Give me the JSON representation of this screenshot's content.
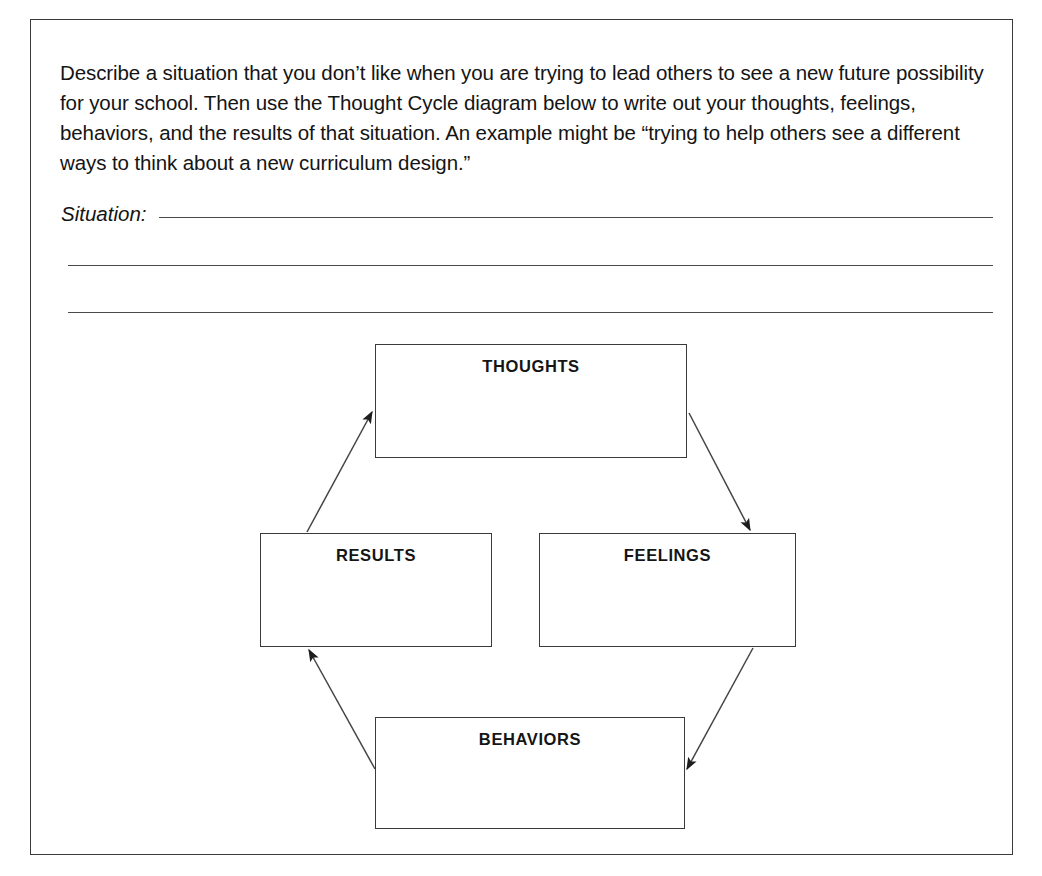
{
  "worksheet": {
    "instructions": "Describe a situation that you don’t like when you are trying to lead others to see a new future possibility for your school. Then use the Thought Cycle diagram below to write out your thoughts, feelings, behaviors, and the results of that situation. An example might be “trying to help others see a different ways to think about a new curriculum design.”",
    "situation_label": "Situation:",
    "answer_lines": [
      "",
      "",
      ""
    ]
  },
  "diagram": {
    "name": "Thought Cycle",
    "boxes": [
      {
        "id": "thoughts",
        "label": "THOUGHTS",
        "value": ""
      },
      {
        "id": "feelings",
        "label": "FEELINGS",
        "value": ""
      },
      {
        "id": "behaviors",
        "label": "BEHAVIORS",
        "value": ""
      },
      {
        "id": "results",
        "label": "RESULTS",
        "value": ""
      }
    ],
    "arrows": [
      {
        "from": "results",
        "to": "thoughts"
      },
      {
        "from": "thoughts",
        "to": "feelings"
      },
      {
        "from": "feelings",
        "to": "behaviors"
      },
      {
        "from": "behaviors",
        "to": "results"
      }
    ]
  },
  "colors": {
    "page_background": "#ffffff",
    "border": "#3a3a3a",
    "rule_line": "#4a4a4a",
    "text": "#141414"
  }
}
